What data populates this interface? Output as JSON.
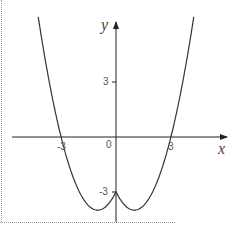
{
  "chart_data": {
    "type": "line",
    "title": "",
    "function": "y = x^2 - 2|x| - 3",
    "xlabel": "x",
    "ylabel": "y",
    "x_ticks": [
      "-3",
      "0",
      "3"
    ],
    "y_ticks": [
      "3",
      "-3"
    ],
    "xlim": [
      -5.8,
      6.3
    ],
    "ylim": [
      -4.2,
      6.5
    ],
    "grid": false,
    "legend": null,
    "series": [
      {
        "name": "curve",
        "x": [
          -4.2,
          -3,
          -2,
          -1,
          0,
          1,
          2,
          3,
          4.2
        ],
        "y": [
          5.24,
          0,
          -3,
          -4,
          -3,
          -4,
          -3,
          0,
          5.24
        ]
      }
    ],
    "key_points": {
      "roots": [
        -3,
        3
      ],
      "y_intercept": -3,
      "minima": [
        [
          -1,
          -4
        ],
        [
          1,
          -4
        ]
      ]
    }
  },
  "labels": {
    "x_axis": "x",
    "y_axis": "y",
    "origin": "0",
    "x_neg3": "-3",
    "x_pos3": "3",
    "y_pos3": "3",
    "y_neg3": "-3"
  }
}
